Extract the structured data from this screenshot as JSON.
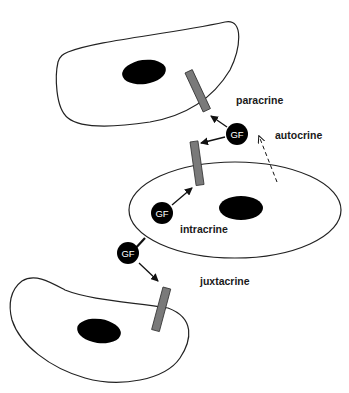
{
  "diagram": {
    "type": "growth-factor-signaling-modes",
    "colors": {
      "background": "#ffffff",
      "cell_outline": "#222222",
      "nucleus": "#000000",
      "receptor_fill": "#7a7a7a",
      "receptor_stroke": "#333333",
      "growth_factor": "#000000",
      "growth_factor_text": "#ffffff",
      "arrow": "#111111"
    },
    "cells": [
      {
        "id": "top-cell",
        "role": "target cell (paracrine)"
      },
      {
        "id": "middle-cell",
        "role": "producing cell (autocrine/intracrine)"
      },
      {
        "id": "bottom-cell",
        "role": "adjacent cell (juxtacrine)"
      }
    ],
    "growth_factor_label": "GF",
    "growth_factors": [
      {
        "id": "gf-paracrine-autocrine",
        "label": "GF"
      },
      {
        "id": "gf-intracrine",
        "label": "GF"
      },
      {
        "id": "gf-juxtacrine",
        "label": "GF"
      }
    ],
    "labels": {
      "paracrine": "paracrine",
      "autocrine": "autocrine",
      "intracrine": "intracrine",
      "juxtacrine": "juxtacrine"
    }
  }
}
